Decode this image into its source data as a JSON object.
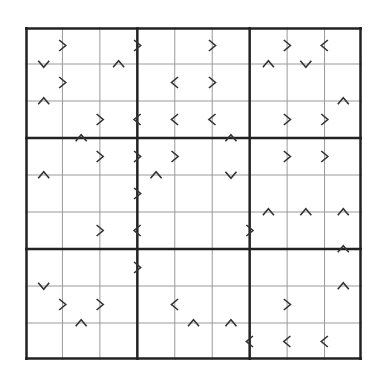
{
  "puzzle": {
    "type": "greater-than-sudoku",
    "size": 9,
    "box": 3,
    "cells": [
      [
        "",
        "",
        "",
        "",
        "",
        "",
        "",
        "",
        ""
      ],
      [
        "",
        "",
        "",
        "",
        "",
        "",
        "",
        "",
        ""
      ],
      [
        "",
        "",
        "",
        "",
        "",
        "",
        "",
        "",
        ""
      ],
      [
        "",
        "",
        "",
        "",
        "",
        "",
        "",
        "",
        ""
      ],
      [
        "",
        "",
        "",
        "",
        "",
        "",
        "",
        "",
        ""
      ],
      [
        "",
        "",
        "",
        "",
        "",
        "",
        "",
        "",
        ""
      ],
      [
        "",
        "",
        "",
        "",
        "",
        "",
        "",
        "",
        ""
      ],
      [
        "",
        "",
        "",
        "",
        "",
        "",
        "",
        "",
        ""
      ],
      [
        "",
        "",
        "",
        "",
        "",
        "",
        "",
        "",
        ""
      ]
    ],
    "horizontal_signs": [
      {
        "row": 0,
        "col": 0,
        "sign": ">"
      },
      {
        "row": 0,
        "col": 2,
        "sign": ">"
      },
      {
        "row": 0,
        "col": 4,
        "sign": ">"
      },
      {
        "row": 0,
        "col": 6,
        "sign": ">"
      },
      {
        "row": 0,
        "col": 7,
        "sign": "<"
      },
      {
        "row": 1,
        "col": 0,
        "sign": ">"
      },
      {
        "row": 1,
        "col": 3,
        "sign": "<"
      },
      {
        "row": 1,
        "col": 4,
        "sign": ">"
      },
      {
        "row": 2,
        "col": 1,
        "sign": ">"
      },
      {
        "row": 2,
        "col": 2,
        "sign": "<"
      },
      {
        "row": 2,
        "col": 3,
        "sign": "<"
      },
      {
        "row": 2,
        "col": 4,
        "sign": "<"
      },
      {
        "row": 2,
        "col": 6,
        "sign": ">"
      },
      {
        "row": 2,
        "col": 7,
        "sign": ">"
      },
      {
        "row": 3,
        "col": 1,
        "sign": ">"
      },
      {
        "row": 3,
        "col": 2,
        "sign": ">"
      },
      {
        "row": 3,
        "col": 3,
        "sign": ">"
      },
      {
        "row": 3,
        "col": 6,
        "sign": ">"
      },
      {
        "row": 3,
        "col": 7,
        "sign": ">"
      },
      {
        "row": 4,
        "col": 2,
        "sign": ">"
      },
      {
        "row": 5,
        "col": 1,
        "sign": ">"
      },
      {
        "row": 5,
        "col": 2,
        "sign": "<"
      },
      {
        "row": 5,
        "col": 5,
        "sign": ">"
      },
      {
        "row": 6,
        "col": 2,
        "sign": ">"
      },
      {
        "row": 7,
        "col": 0,
        "sign": ">"
      },
      {
        "row": 7,
        "col": 1,
        "sign": ">"
      },
      {
        "row": 7,
        "col": 3,
        "sign": "<"
      },
      {
        "row": 7,
        "col": 6,
        "sign": ">"
      },
      {
        "row": 8,
        "col": 5,
        "sign": "<"
      },
      {
        "row": 8,
        "col": 6,
        "sign": "<"
      },
      {
        "row": 8,
        "col": 7,
        "sign": "<"
      }
    ],
    "vertical_signs": [
      {
        "row": 0,
        "col": 0,
        "sign": "v"
      },
      {
        "row": 0,
        "col": 2,
        "sign": "^"
      },
      {
        "row": 0,
        "col": 6,
        "sign": "^"
      },
      {
        "row": 0,
        "col": 7,
        "sign": "v"
      },
      {
        "row": 1,
        "col": 0,
        "sign": "^"
      },
      {
        "row": 1,
        "col": 8,
        "sign": "^"
      },
      {
        "row": 2,
        "col": 1,
        "sign": "^"
      },
      {
        "row": 2,
        "col": 5,
        "sign": "^"
      },
      {
        "row": 3,
        "col": 0,
        "sign": "^"
      },
      {
        "row": 3,
        "col": 3,
        "sign": "^"
      },
      {
        "row": 3,
        "col": 5,
        "sign": "v"
      },
      {
        "row": 4,
        "col": 6,
        "sign": "^"
      },
      {
        "row": 4,
        "col": 7,
        "sign": "^"
      },
      {
        "row": 4,
        "col": 8,
        "sign": "^"
      },
      {
        "row": 5,
        "col": 8,
        "sign": "^"
      },
      {
        "row": 6,
        "col": 0,
        "sign": "v"
      },
      {
        "row": 6,
        "col": 8,
        "sign": "^"
      },
      {
        "row": 7,
        "col": 1,
        "sign": "^"
      },
      {
        "row": 7,
        "col": 4,
        "sign": "^"
      },
      {
        "row": 7,
        "col": 5,
        "sign": "^"
      }
    ]
  },
  "colors": {
    "thin_line": "#9a9a9a",
    "thick_line": "#222222",
    "sign": "#333333",
    "background": "#ffffff"
  }
}
